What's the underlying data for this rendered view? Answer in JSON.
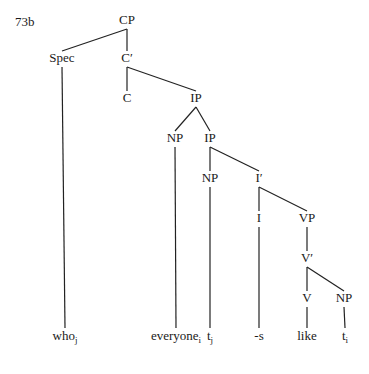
{
  "example_id": "73b",
  "tree": {
    "nodes": [
      {
        "id": "cp",
        "label": "CP",
        "x": 127,
        "y": 20
      },
      {
        "id": "spec",
        "label": "Spec",
        "x": 62,
        "y": 58
      },
      {
        "id": "cbar",
        "label": "C′",
        "x": 127,
        "y": 58
      },
      {
        "id": "c",
        "label": "C",
        "x": 127,
        "y": 98
      },
      {
        "id": "ip1",
        "label": "IP",
        "x": 196,
        "y": 98
      },
      {
        "id": "np1",
        "label": "NP",
        "x": 175,
        "y": 138
      },
      {
        "id": "ip2",
        "label": "IP",
        "x": 210,
        "y": 138
      },
      {
        "id": "np2",
        "label": "NP",
        "x": 210,
        "y": 178
      },
      {
        "id": "ibar",
        "label": "I′",
        "x": 259,
        "y": 178
      },
      {
        "id": "i",
        "label": "I",
        "x": 259,
        "y": 218
      },
      {
        "id": "vp",
        "label": "VP",
        "x": 307,
        "y": 218
      },
      {
        "id": "vbar",
        "label": "V′",
        "x": 307,
        "y": 258
      },
      {
        "id": "v",
        "label": "V",
        "x": 307,
        "y": 298
      },
      {
        "id": "np3",
        "label": "NP",
        "x": 344,
        "y": 298
      }
    ],
    "leaves": [
      {
        "id": "who",
        "word": "who",
        "sub": "j",
        "x": 65,
        "y": 336
      },
      {
        "id": "everyone",
        "word": "everyone",
        "sub": "i",
        "x": 176,
        "y": 336
      },
      {
        "id": "tj",
        "word": "t",
        "sub": "j",
        "x": 210,
        "y": 336
      },
      {
        "id": "s",
        "word": "-s",
        "sub": "",
        "x": 259,
        "y": 336
      },
      {
        "id": "like",
        "word": "like",
        "sub": "",
        "x": 307,
        "y": 336
      },
      {
        "id": "ti",
        "word": "t",
        "sub": "i",
        "x": 345,
        "y": 336
      }
    ],
    "edges": [
      [
        "cp",
        "spec"
      ],
      [
        "cp",
        "cbar"
      ],
      [
        "cbar",
        "c"
      ],
      [
        "cbar",
        "ip1"
      ],
      [
        "ip1",
        "np1"
      ],
      [
        "ip1",
        "ip2"
      ],
      [
        "ip2",
        "np2"
      ],
      [
        "ip2",
        "ibar"
      ],
      [
        "ibar",
        "i"
      ],
      [
        "ibar",
        "vp"
      ],
      [
        "vp",
        "vbar"
      ],
      [
        "vbar",
        "v"
      ],
      [
        "vbar",
        "np3"
      ],
      [
        "spec",
        "who"
      ],
      [
        "np1",
        "everyone"
      ],
      [
        "np2",
        "tj"
      ],
      [
        "i",
        "s"
      ],
      [
        "v",
        "like"
      ],
      [
        "np3",
        "ti"
      ]
    ]
  }
}
